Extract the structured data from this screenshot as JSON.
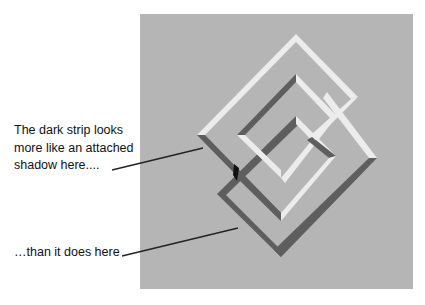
{
  "figure": {
    "background_color": "#ffffff",
    "panel": {
      "x": 140,
      "y": 14,
      "width": 273,
      "height": 275,
      "color": "#b5b5b5"
    },
    "colors": {
      "light": "#ececec",
      "dark": "#5e5e5e",
      "darkest": "#111111"
    }
  },
  "annotations": [
    {
      "text_lines": [
        "The dark strip looks",
        "more like an attached",
        "shadow here...."
      ],
      "text": "The dark strip looks more like an attached shadow here....",
      "line": [
        112,
        170,
        203,
        148
      ]
    },
    {
      "text": "…than it does here",
      "line": [
        122,
        256,
        238,
        228
      ]
    }
  ]
}
